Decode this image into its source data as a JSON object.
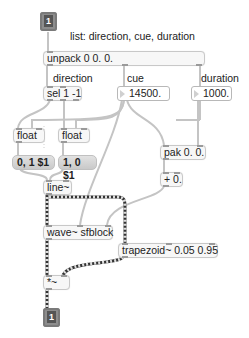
{
  "patch": {
    "inlet": {
      "index": "1"
    },
    "outlet": {
      "index": "1"
    },
    "comments": {
      "list": "list: direction, cue, duration",
      "direction": "direction",
      "cue": "cue",
      "duration": "duration"
    },
    "objects": {
      "unpack": "unpack 0 0. 0.",
      "sel": "sel 1 -1",
      "float_left": "float",
      "float_right": "float",
      "line": "line~",
      "pak": "pak 0. 0.",
      "plus": "+ 0.",
      "wave": "wave~ sfblock",
      "trapezoid": "trapezoid~ 0.05 0.95",
      "times": "*~"
    },
    "numbers": {
      "cue": "14500.",
      "duration": "1000."
    },
    "messages": {
      "forward": "0, 1 $1",
      "reverse": "1, 0 $1"
    },
    "colors": {
      "control_cord": "#c4c4c4",
      "signal_cord_dark": "#333333",
      "signal_cord_light": "#e8e060",
      "inlet_box": "#8d8d8d"
    }
  }
}
